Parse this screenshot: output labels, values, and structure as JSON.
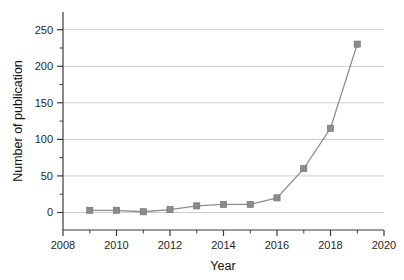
{
  "chart_data": {
    "type": "line",
    "title": "",
    "subtitle": "",
    "xlabel": "Year",
    "ylabel": "Number of publication",
    "xlim": [
      2008,
      2020
    ],
    "ylim": [
      -25,
      265
    ],
    "x": [
      2009,
      2010,
      2011,
      2012,
      2013,
      2014,
      2015,
      2016,
      2017,
      2018,
      2019
    ],
    "values": [
      3,
      3,
      1,
      4,
      9,
      11,
      11,
      20,
      60,
      115,
      230
    ],
    "series": [
      {
        "name": "Number of publication",
        "values": [
          3,
          3,
          1,
          4,
          9,
          11,
          11,
          20,
          60,
          115,
          230
        ]
      }
    ],
    "x_tick_labels": [
      "2008",
      "2010",
      "2012",
      "2014",
      "2016",
      "2018",
      "2020"
    ],
    "x_tick_values": [
      2008,
      2010,
      2012,
      2014,
      2016,
      2018,
      2020
    ],
    "x_minor_tick_values": [
      2009,
      2011,
      2013,
      2015,
      2017,
      2019
    ],
    "y_tick_labels": [
      "0",
      "50",
      "100",
      "150",
      "200",
      "250"
    ],
    "y_tick_values": [
      0,
      50,
      100,
      150,
      200,
      250
    ],
    "y_minor_tick_values": [
      25,
      75,
      125,
      175,
      225
    ],
    "grid": "horizontal-major",
    "legend": "none",
    "marker": "square",
    "colors": {
      "line": "#8d8d8d",
      "marker": "#8b8b8b",
      "gridline": "#bfbfbf",
      "axis": "#3a3a3a",
      "text": "#1f1f1f",
      "background": "#ffffff"
    }
  }
}
